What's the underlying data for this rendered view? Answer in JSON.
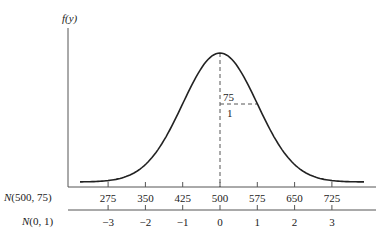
{
  "chart_data": {
    "type": "line",
    "title": "",
    "ylabel": "f(y)",
    "curve": "normal density",
    "mean": 500,
    "sd": 75,
    "axes": [
      {
        "name": "N(500, 75)",
        "ticks": [
          "275",
          "350",
          "425",
          "500",
          "575",
          "650",
          "725"
        ]
      },
      {
        "name": "N(0, 1)",
        "ticks": [
          "−3",
          "−2",
          "−1",
          "0",
          "1",
          "2",
          "3"
        ]
      }
    ],
    "annotations": {
      "sd_original": "75",
      "sd_standard": "1"
    },
    "grid": false
  },
  "labels": {
    "y_axis": "f(y)",
    "axis1_name_italic": "N",
    "axis1_name_rest": "(500, 75)",
    "axis2_name_italic": "N",
    "axis2_name_rest": "(0, 1)",
    "sd_top": "75",
    "sd_bottom": "1"
  },
  "colors": {
    "curve": "#222222",
    "axis": "#555555",
    "dash": "#555555"
  }
}
